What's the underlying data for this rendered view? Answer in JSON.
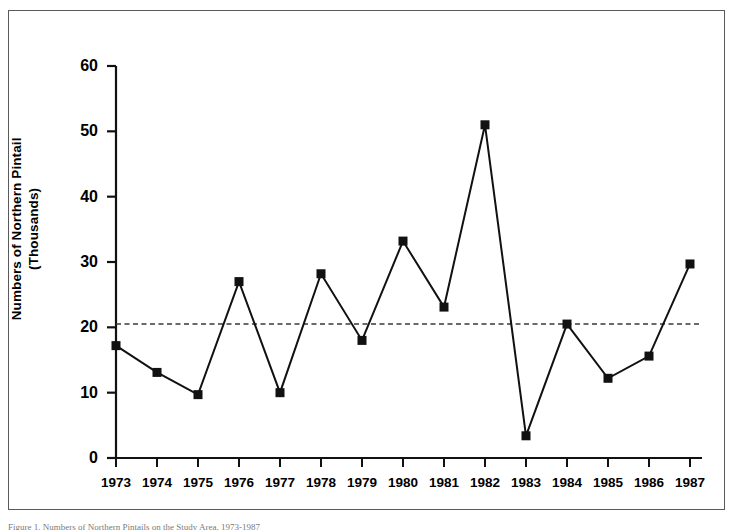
{
  "figure": {
    "border_color": "#5a5a5a",
    "background": "#ffffff"
  },
  "axis": {
    "y_label_line1": "Numbers of Northern Pintail",
    "y_label_line2": "(Thousands)",
    "y_ticks": [
      "0",
      "10",
      "20",
      "30",
      "40",
      "50",
      "60"
    ],
    "x_ticks": [
      "1973",
      "1974",
      "1975",
      "1976",
      "1977",
      "1978",
      "1979",
      "1980",
      "1981",
      "1982",
      "1983",
      "1984",
      "1985",
      "1986",
      "1987"
    ]
  },
  "caption": {
    "text": "Figure 1. Numbers of Northern Pintails on the Study Area, 1973-1987"
  },
  "chart_data": {
    "type": "line",
    "title": "",
    "xlabel": "",
    "ylabel": "Numbers of Northern Pintail (Thousands)",
    "categories": [
      "1973",
      "1974",
      "1975",
      "1976",
      "1977",
      "1978",
      "1979",
      "1980",
      "1981",
      "1982",
      "1983",
      "1984",
      "1985",
      "1986",
      "1987"
    ],
    "x": [
      1973,
      1974,
      1975,
      1976,
      1977,
      1978,
      1979,
      1980,
      1981,
      1982,
      1983,
      1984,
      1985,
      1986,
      1987
    ],
    "values": [
      17.2,
      13.1,
      9.7,
      27.0,
      10.0,
      28.2,
      18.0,
      33.2,
      23.1,
      51.0,
      3.4,
      20.5,
      12.2,
      15.6,
      29.7
    ],
    "ylim": [
      0,
      60
    ],
    "xlim": [
      1973,
      1987
    ],
    "ytick_step": 10,
    "grid": false,
    "legend": "none",
    "marker": "square",
    "marker_color": "#111111",
    "line_color": "#111111",
    "reference_line": {
      "value": 20.5,
      "style": "dashed",
      "color": "#3a3a3a",
      "label": ""
    }
  }
}
